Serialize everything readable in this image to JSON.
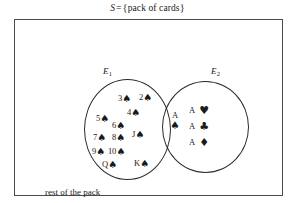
{
  "title": {
    "symbol": "S",
    "equals": "=",
    "open_brace": "{",
    "contents": "pack of cards",
    "close_brace": "}",
    "full_text": "S = {pack of cards}"
  },
  "diagram": {
    "type": "venn-diagram",
    "universe_label": "S",
    "caption": "rest of the pack",
    "sets": [
      {
        "id": "E1",
        "label": "E",
        "subscript": "1",
        "description": "spades"
      },
      {
        "id": "E2",
        "label": "E",
        "subscript": "2",
        "description": "aces"
      }
    ]
  },
  "colors": {
    "ink": "#1a1a1a",
    "circle_stroke": "#2b2b2b",
    "rect_stroke": "#4a4a4a",
    "background": "#ffffff"
  },
  "suits": {
    "spade": "♠",
    "heart": "♥",
    "club": "♣",
    "diamond": "♦"
  },
  "e1_only_cards": [
    {
      "rank": "3",
      "suit": "♠"
    },
    {
      "rank": "2",
      "suit": "♠"
    },
    {
      "rank": "4",
      "suit": "♠"
    },
    {
      "rank": "5",
      "suit": "♠"
    },
    {
      "rank": "6",
      "suit": "♠"
    },
    {
      "rank": "J",
      "suit": "♠"
    },
    {
      "rank": "7",
      "suit": "♠"
    },
    {
      "rank": "8",
      "suit": "♠"
    },
    {
      "rank": "9",
      "suit": "♠"
    },
    {
      "rank": "10",
      "suit": "♠"
    },
    {
      "rank": "Q",
      "suit": "♠"
    },
    {
      "rank": "K",
      "suit": "♠"
    }
  ],
  "intersection_cards": [
    {
      "rank": "A",
      "suit": "♠"
    }
  ],
  "e2_only_cards": [
    {
      "rank": "A",
      "suit": "♥"
    },
    {
      "rank": "A",
      "suit": "♣"
    },
    {
      "rank": "A",
      "suit": "♦"
    }
  ]
}
